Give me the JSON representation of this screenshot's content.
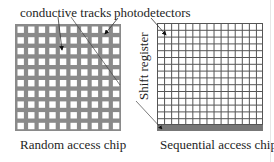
{
  "labels": {
    "conductive_tracks": "conductive tracks",
    "photodetectors": "photodetectors",
    "shift_register": "Shift register",
    "random_access": "Random access chip",
    "sequential_access": "Sequential access chip"
  },
  "left_chip": {
    "name": "Random access chip",
    "rows": 10,
    "cols": 10,
    "track_color": "#8a8a8a",
    "pixel_color": "#ffffff"
  },
  "right_chip": {
    "name": "Sequential access chip",
    "rows": 15,
    "cols": 15,
    "line_color": "#555555",
    "register_color": "#777777"
  }
}
